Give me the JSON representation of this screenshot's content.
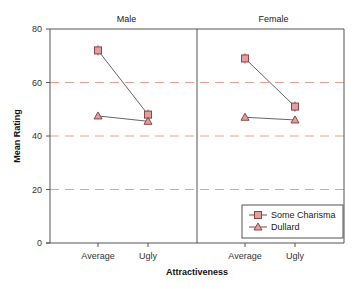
{
  "chart_data": {
    "type": "line",
    "title": "",
    "xlabel": "Attractiveness",
    "ylabel": "Mean Rating",
    "ylim": [
      0,
      80
    ],
    "yticks": [
      0,
      20,
      40,
      60,
      80
    ],
    "grid": {
      "type": "dashed-horizontal",
      "at": [
        20,
        40,
        60
      ],
      "color": "#e8a090"
    },
    "panels": [
      {
        "title": "Male",
        "categories": [
          "Average",
          "Ugly"
        ],
        "series": [
          {
            "name": "Some Charisma",
            "marker": "square",
            "values": [
              72,
              48
            ]
          },
          {
            "name": "Dullard",
            "marker": "triangle",
            "values": [
              47.5,
              45.5
            ]
          }
        ]
      },
      {
        "title": "Female",
        "categories": [
          "Average",
          "Ugly"
        ],
        "series": [
          {
            "name": "Some Charisma",
            "marker": "square",
            "values": [
              69,
              51
            ]
          },
          {
            "name": "Dullard",
            "marker": "triangle",
            "values": [
              47,
              46
            ]
          }
        ]
      }
    ],
    "legend": {
      "position": "bottom-right (inside Female panel)",
      "entries": [
        {
          "label": "Some Charisma",
          "marker": "square"
        },
        {
          "label": "Dullard",
          "marker": "triangle"
        }
      ]
    }
  },
  "colors": {
    "marker_fill": "#e0a0a0",
    "marker_edge": "#8b4545",
    "line": "#666666",
    "grid": "#e8a090",
    "axis": "#555555"
  }
}
